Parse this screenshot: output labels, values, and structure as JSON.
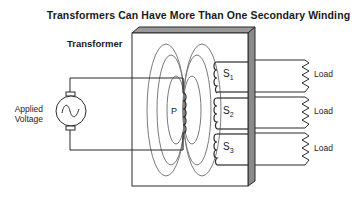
{
  "title": "Transformers Can Have More Than One Secondary Winding",
  "transformer_label": "Transformer",
  "source": {
    "label_line1": "Applied",
    "label_line2": "Voltage",
    "icon": "ac-source-sine-icon"
  },
  "primary": {
    "label": "P"
  },
  "secondaries": [
    {
      "label": "S",
      "sub": "1",
      "load": "Load"
    },
    {
      "label": "S",
      "sub": "2",
      "load": "Load"
    },
    {
      "label": "S",
      "sub": "3",
      "load": "Load"
    }
  ],
  "colors": {
    "line": "#2a2a2a",
    "flux": "#7a7a7a",
    "core_side": "#8a8a8a",
    "core_top": "#9a9a9a"
  }
}
